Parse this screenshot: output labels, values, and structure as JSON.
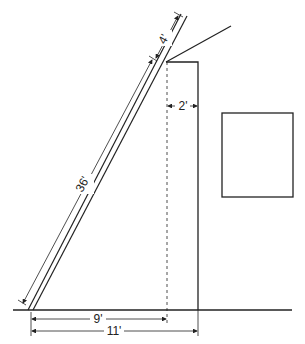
{
  "diagram": {
    "type": "ladder-against-wall",
    "labels": {
      "ladder_top_extension": "4'",
      "ladder_length": "36'",
      "wall_offset": "2'",
      "base_to_support": "9'",
      "base_to_wall": "11'"
    },
    "colors": {
      "stroke": "#222222",
      "background": "#ffffff"
    }
  }
}
